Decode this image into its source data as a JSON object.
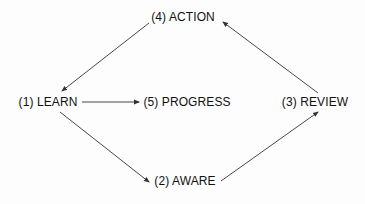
{
  "diagram": {
    "type": "cycle-flow",
    "colors": {
      "text": "#111111",
      "arrow": "#333333",
      "background": "#fdfdfd"
    },
    "nodes": [
      {
        "id": "learn",
        "label": "(1) LEARN",
        "x": 48,
        "y": 102
      },
      {
        "id": "aware",
        "label": "(2) AWARE",
        "x": 185,
        "y": 181
      },
      {
        "id": "review",
        "label": "(3) REVIEW",
        "x": 315,
        "y": 102
      },
      {
        "id": "action",
        "label": "(4) ACTION",
        "x": 183,
        "y": 17
      },
      {
        "id": "progress",
        "label": "(5) PROGRESS",
        "x": 187,
        "y": 102
      }
    ],
    "edges": [
      {
        "from": "action",
        "to": "learn",
        "x1": 149,
        "y1": 23,
        "x2": 62,
        "y2": 91
      },
      {
        "from": "learn",
        "to": "progress",
        "x1": 82,
        "y1": 102,
        "x2": 139,
        "y2": 102
      },
      {
        "from": "learn",
        "to": "aware",
        "x1": 60,
        "y1": 112,
        "x2": 149,
        "y2": 182
      },
      {
        "from": "aware",
        "to": "review",
        "x1": 221,
        "y1": 181,
        "x2": 318,
        "y2": 112
      },
      {
        "from": "review",
        "to": "action",
        "x1": 318,
        "y1": 93,
        "x2": 223,
        "y2": 22
      }
    ]
  }
}
